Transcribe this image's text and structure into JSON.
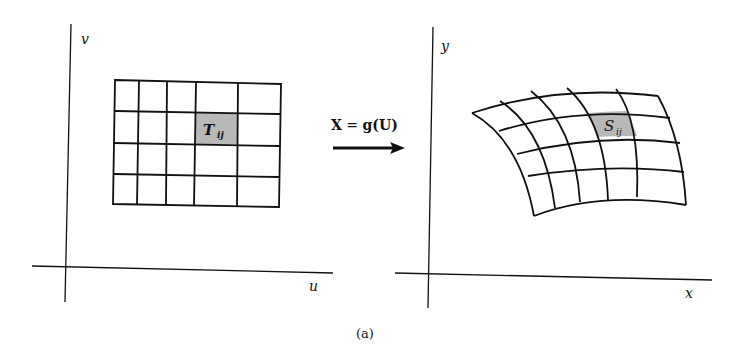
{
  "figure": {
    "caption": "(a)",
    "left_panel": {
      "x_axis_label": "u",
      "y_axis_label": "v",
      "highlight_cell_label": "T",
      "highlight_cell_subscript": "ij",
      "grid_columns": 5,
      "grid_rows": 4,
      "highlight_cell": {
        "row": 1,
        "col": 3
      }
    },
    "right_panel": {
      "x_axis_label": "x",
      "y_axis_label": "y",
      "highlight_cell_label": "S",
      "highlight_cell_subscript": "ij",
      "grid_columns": 5,
      "grid_rows": 4,
      "highlight_cell": {
        "row": 1,
        "col": 3
      }
    },
    "mapping": {
      "equation_lhs": "X",
      "equation_eq": " = ",
      "equation_rhs": "g(U)",
      "arrow_direction": "right"
    },
    "colors": {
      "line": "#111111",
      "highlight_fill": "#b8b8b8",
      "background": "#ffffff"
    }
  }
}
